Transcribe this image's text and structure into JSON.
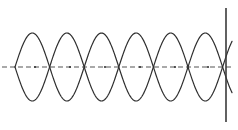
{
  "figure": {
    "name": "standing-wave-diagram",
    "width": 238,
    "height": 130,
    "background_color": "#ffffff"
  },
  "chart_data": {
    "type": "line",
    "title": "",
    "subtitle": "",
    "xlabel": "",
    "ylabel": "",
    "grid": false,
    "legend_position": "none",
    "tick_labels": {
      "x": [],
      "y": []
    },
    "annotations": [],
    "xlim": [
      0,
      238
    ],
    "ylim": [
      -40,
      40
    ],
    "axis": {
      "name": "equilibrium-axis",
      "orientation": "horizontal",
      "y_pixel": 67,
      "x_start_pixel": 2,
      "x_end_pixel": 232,
      "style": "dashed",
      "dash_pattern": "5,3",
      "color": "#555555",
      "width": 1.2
    },
    "boundary": {
      "name": "right-boundary-line",
      "orientation": "vertical",
      "x_pixel": 226,
      "y_start_pixel": 8,
      "y_end_pixel": 122,
      "style": "solid",
      "color": "#3a3a3a",
      "width": 1.6
    },
    "wave_parameters": {
      "amplitude_pixels": 34,
      "half_period_pixels": 34.6,
      "period_pixels": 69.2,
      "centerline_y_pixel": 67,
      "x_start_pixel": 15,
      "x_end_pixel": 232,
      "cycles_visible": 3.1,
      "stroke_color": "#2e2e2e",
      "stroke_width": 1.2
    },
    "series": [
      {
        "name": "wave-positive-phase",
        "phase_degrees": 0,
        "color": "#2e2e2e",
        "description": "sine curve rising first"
      },
      {
        "name": "wave-negative-phase",
        "phase_degrees": 180,
        "color": "#2e2e2e",
        "description": "inverted sine curve, mirror of the first"
      }
    ],
    "nodes": {
      "name": "crossing-points",
      "count": 6,
      "x_pixels": [
        35,
        70,
        105,
        140,
        175,
        208
      ],
      "y_pixel": 67,
      "marker_color": "#333333"
    }
  }
}
